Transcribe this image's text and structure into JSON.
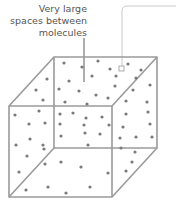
{
  "label": {
    "lines": [
      "Very large",
      "spaces between",
      "molecules"
    ]
  },
  "colors": {
    "edge": "#9a9a9a",
    "dot": "#7a7a7a",
    "leader": "#333333",
    "callout": "#c8c8c8",
    "text": "#555555"
  },
  "cube": {
    "back": {
      "x1": 54,
      "y1": 57,
      "x2": 157,
      "y2": 148
    },
    "offset": {
      "dx": -45,
      "dy": 49
    }
  },
  "molecules": [
    [
      64,
      63
    ],
    [
      82,
      67
    ],
    [
      98,
      61
    ],
    [
      110,
      69
    ],
    [
      128,
      64
    ],
    [
      141,
      70
    ],
    [
      47,
      79
    ],
    [
      69,
      81
    ],
    [
      92,
      76
    ],
    [
      116,
      76
    ],
    [
      136,
      78
    ],
    [
      150,
      85
    ],
    [
      36,
      90
    ],
    [
      59,
      89
    ],
    [
      79,
      91
    ],
    [
      96,
      95
    ],
    [
      115,
      86
    ],
    [
      133,
      90
    ],
    [
      43,
      100
    ],
    [
      65,
      102
    ],
    [
      87,
      104
    ],
    [
      108,
      98
    ],
    [
      126,
      101
    ],
    [
      147,
      102
    ],
    [
      15,
      115
    ],
    [
      39,
      111
    ],
    [
      60,
      114
    ],
    [
      73,
      113
    ],
    [
      86,
      118
    ],
    [
      102,
      117
    ],
    [
      126,
      114
    ],
    [
      148,
      112
    ],
    [
      29,
      124
    ],
    [
      45,
      123
    ],
    [
      60,
      124
    ],
    [
      84,
      125
    ],
    [
      109,
      125
    ],
    [
      123,
      127
    ],
    [
      150,
      124
    ],
    [
      16,
      145
    ],
    [
      30,
      139
    ],
    [
      43,
      145
    ],
    [
      61,
      136
    ],
    [
      85,
      133
    ],
    [
      100,
      134
    ],
    [
      120,
      138
    ],
    [
      136,
      137
    ],
    [
      152,
      137
    ],
    [
      27,
      156
    ],
    [
      44,
      149
    ],
    [
      88,
      145
    ],
    [
      121,
      148
    ],
    [
      135,
      152
    ],
    [
      19,
      172
    ],
    [
      45,
      164
    ],
    [
      61,
      162
    ],
    [
      81,
      167
    ],
    [
      108,
      173
    ],
    [
      126,
      171
    ],
    [
      26,
      190
    ],
    [
      48,
      187
    ],
    [
      66,
      193
    ],
    [
      90,
      187
    ],
    [
      132,
      162
    ]
  ]
}
